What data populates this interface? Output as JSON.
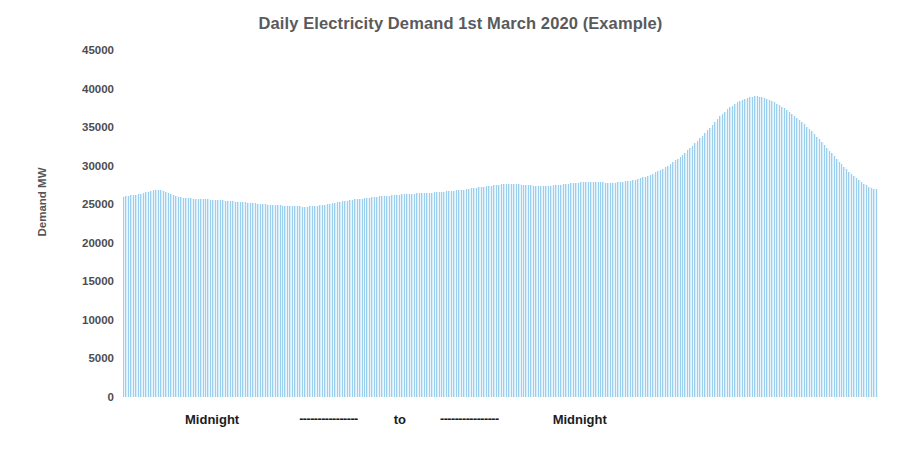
{
  "chart_data": {
    "type": "bar",
    "title": "Daily Electricity Demand 1st March 2020 (Example)",
    "xlabel": "Midnight ---------------- to ---------------- Midnight",
    "ylabel": "Demand MW",
    "ylim": [
      0,
      45000
    ],
    "ytick_labels": [
      "45000",
      "40000",
      "35000",
      "30000",
      "25000",
      "20000",
      "15000",
      "10000",
      "5000",
      "0"
    ],
    "yticks": [
      45000,
      40000,
      35000,
      30000,
      25000,
      20000,
      15000,
      10000,
      5000,
      0
    ],
    "grid": false,
    "legend": null,
    "bar_color": "#d8ecf9",
    "bar_edge_color": "#9ccfee",
    "title_color": "#5a5a5c",
    "axis_text_color": "#4d4d4f",
    "background_color": "#ffffff",
    "x_axis_annotations": {
      "start_label": "Midnight",
      "middle_label": "to",
      "end_label": "Midnight",
      "dash_run": "----------------"
    },
    "series_name": "Demand MW",
    "n_points": 288,
    "interval_minutes": 5,
    "summary": {
      "start_value": 26000,
      "overnight_minimum": 24700,
      "early_bump": 26900,
      "midday_plateau": 27600,
      "evening_peak": 39000,
      "end_value": 27000
    },
    "values": [
      26000,
      26050,
      26100,
      26150,
      26200,
      26250,
      26300,
      26350,
      26450,
      26550,
      26650,
      26750,
      26850,
      26900,
      26900,
      26850,
      26750,
      26600,
      26450,
      26300,
      26150,
      26050,
      25950,
      25900,
      25850,
      25800,
      25780,
      25760,
      25740,
      25720,
      25700,
      25680,
      25660,
      25640,
      25620,
      25600,
      25580,
      25560,
      25540,
      25520,
      25500,
      25470,
      25440,
      25410,
      25380,
      25350,
      25320,
      25290,
      25260,
      25230,
      25200,
      25170,
      25140,
      25110,
      25080,
      25050,
      25020,
      24990,
      24960,
      24930,
      24900,
      24880,
      24860,
      24840,
      24820,
      24800,
      24780,
      24760,
      24740,
      24730,
      24720,
      24710,
      24700,
      24700,
      24700,
      24710,
      24730,
      24760,
      24800,
      24850,
      24900,
      24960,
      25020,
      25080,
      25140,
      25200,
      25260,
      25320,
      25380,
      25430,
      25480,
      25530,
      25580,
      25620,
      25660,
      25700,
      25740,
      25780,
      25820,
      25860,
      25900,
      25940,
      25980,
      26010,
      26040,
      26070,
      26100,
      26130,
      26160,
      26190,
      26220,
      26250,
      26280,
      26300,
      26320,
      26340,
      26360,
      26380,
      26400,
      26420,
      26440,
      26460,
      26480,
      26500,
      26520,
      26540,
      26560,
      26580,
      26600,
      26630,
      26660,
      26690,
      26720,
      26750,
      26790,
      26830,
      26870,
      26910,
      26950,
      27000,
      27050,
      27100,
      27150,
      27200,
      27250,
      27300,
      27340,
      27380,
      27420,
      27460,
      27500,
      27540,
      27570,
      27600,
      27620,
      27630,
      27630,
      27620,
      27600,
      27580,
      27550,
      27520,
      27490,
      27460,
      27430,
      27400,
      27380,
      27360,
      27350,
      27350,
      27360,
      27380,
      27400,
      27430,
      27460,
      27500,
      27540,
      27580,
      27620,
      27660,
      27700,
      27740,
      27770,
      27800,
      27820,
      27840,
      27850,
      27860,
      27860,
      27860,
      27850,
      27840,
      27830,
      27820,
      27810,
      27800,
      27800,
      27800,
      27810,
      27830,
      27860,
      27900,
      27950,
      28000,
      28060,
      28130,
      28200,
      28280,
      28370,
      28470,
      28580,
      28700,
      28830,
      28970,
      29120,
      29280,
      29450,
      29630,
      29820,
      30020,
      30230,
      30450,
      30680,
      30920,
      31170,
      31430,
      31700,
      31980,
      32270,
      32570,
      32880,
      33200,
      33530,
      33870,
      34220,
      34580,
      34950,
      35330,
      35700,
      36060,
      36400,
      36720,
      37020,
      37300,
      37560,
      37800,
      38020,
      38220,
      38400,
      38560,
      38700,
      38820,
      38910,
      38970,
      39000,
      39000,
      38960,
      38890,
      38790,
      38670,
      38530,
      38370,
      38200,
      38020,
      37830,
      37630,
      37420,
      37200,
      36970,
      36730,
      36480,
      36220,
      35950,
      35670,
      35380,
      35080,
      34770,
      34450,
      34120,
      33780,
      33430,
      33070,
      32700,
      32330,
      31960,
      31590,
      31220,
      30860,
      30510,
      30170,
      29840,
      29520,
      29210,
      28910,
      28620,
      28350,
      28090,
      27850,
      27630,
      27430,
      27260,
      27130,
      27040,
      27000
    ]
  }
}
